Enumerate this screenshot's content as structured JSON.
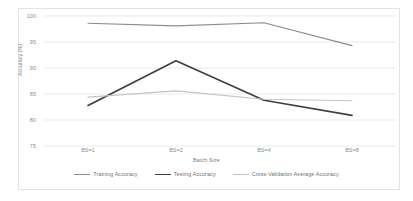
{
  "chart_data": {
    "type": "line",
    "title": "",
    "xlabel": "Batch Size",
    "ylabel": "Accuracy (%)",
    "categories": [
      "BS=1",
      "BS=2",
      "BS=4",
      "BS=8"
    ],
    "ylim": [
      75,
      100
    ],
    "yticks": [
      75,
      80,
      85,
      90,
      95,
      100
    ],
    "grid": true,
    "legend_position": "bottom",
    "series": [
      {
        "name": "Training Accuracy",
        "values": [
          98.6,
          98.1,
          98.7,
          94.3
        ],
        "color": "#8c8c8c",
        "width": 1.1
      },
      {
        "name": "Testing Accuracy",
        "values": [
          82.8,
          91.4,
          83.8,
          80.9
        ],
        "color": "#3f3f3f",
        "width": 1.7
      },
      {
        "name": "Cross-Validation Average Accuracy",
        "values": [
          84.4,
          85.6,
          84.0,
          83.7
        ],
        "color": "#c4c4c4",
        "width": 1.1
      }
    ]
  },
  "axes": {
    "y_title": "Accuracy (%)",
    "x_title": "Batch Size",
    "y_tick_labels": [
      "100",
      "95",
      "90",
      "85",
      "80",
      "75"
    ],
    "x_tick_labels": [
      "BS=1",
      "BS=2",
      "BS=4",
      "BS=8"
    ]
  },
  "legend": {
    "items": [
      {
        "label": "Training Accuracy"
      },
      {
        "label": "Testing Accuracy"
      },
      {
        "label": "Cross-Validation Average Accuracy"
      }
    ]
  },
  "colors": {
    "gridline": "#e6e6e6",
    "frame": "#e3e3e3",
    "tick_text": "#8a8a8a",
    "title_text": "#7b7b7b"
  }
}
